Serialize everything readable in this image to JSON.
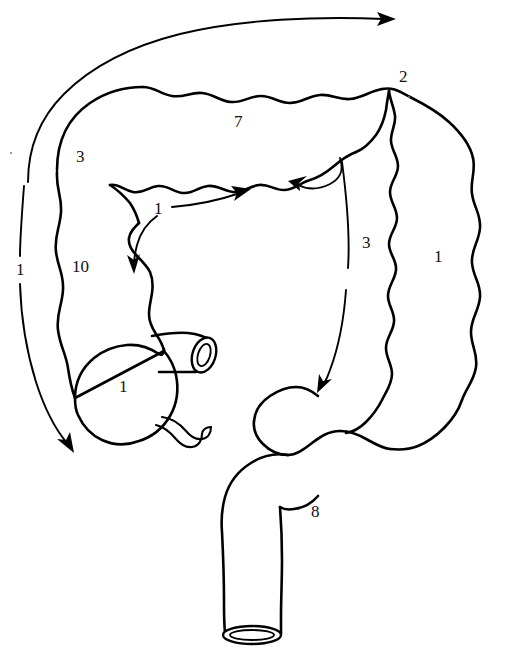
{
  "figure": {
    "type": "anatomical-line-drawing",
    "background_color": "#ffffff",
    "line_color": "#000000",
    "structures": [
      "ascending colon",
      "transverse colon",
      "descending colon",
      "sigmoid colon",
      "cecum",
      "appendix",
      "ileum",
      "rectum",
      "anal canal"
    ]
  },
  "labels": [
    {
      "id": "label-left-1",
      "text": "1",
      "x": 16,
      "y": 261,
      "note": "left margin, on long descending flow arrow"
    },
    {
      "id": "label-hepatic-3",
      "text": "3",
      "x": 76,
      "y": 148,
      "note": "upper left, hepatic flexure region"
    },
    {
      "id": "label-transverse-7",
      "text": "7",
      "x": 234,
      "y": 113,
      "note": "transverse colon"
    },
    {
      "id": "label-splenic-2",
      "text": "2",
      "x": 399,
      "y": 68,
      "note": "upper right, splenic flexure region"
    },
    {
      "id": "label-descend-1",
      "text": "1",
      "x": 434,
      "y": 248,
      "note": "right side, descending colon"
    },
    {
      "id": "label-mid-3",
      "text": "3",
      "x": 362,
      "y": 234,
      "note": "middle right, on double-headed arrow"
    },
    {
      "id": "label-mid-1",
      "text": "1",
      "x": 154,
      "y": 200,
      "note": "middle, on arrow pair"
    },
    {
      "id": "label-ascend-10",
      "text": "10",
      "x": 72,
      "y": 258,
      "note": "left, ascending colon"
    },
    {
      "id": "label-cecum-1",
      "text": "1",
      "x": 119,
      "y": 378,
      "note": "cecum"
    },
    {
      "id": "label-sigmoid-8",
      "text": "8",
      "x": 311,
      "y": 503,
      "note": "sigmoid colon"
    }
  ],
  "arrows": [
    {
      "id": "arrow-top-right",
      "direction": "right",
      "description": "long arc over transverse colon pointing right"
    },
    {
      "id": "arrow-left-down",
      "direction": "down",
      "description": "long arc down left margin ending at cecum"
    },
    {
      "id": "arrow-mid-right",
      "direction": "right",
      "description": "short arrow from label 1 pointing right"
    },
    {
      "id": "arrow-mid-down",
      "direction": "down",
      "description": "short curved arrow from label 1 pointing down"
    },
    {
      "id": "arrow-upper-left",
      "direction": "left",
      "description": "arrow from mid-right curve pointing left"
    },
    {
      "id": "arrow-lower-down",
      "direction": "down-left",
      "description": "arrow from mid-right curve pointing down-left into sigmoid"
    }
  ]
}
